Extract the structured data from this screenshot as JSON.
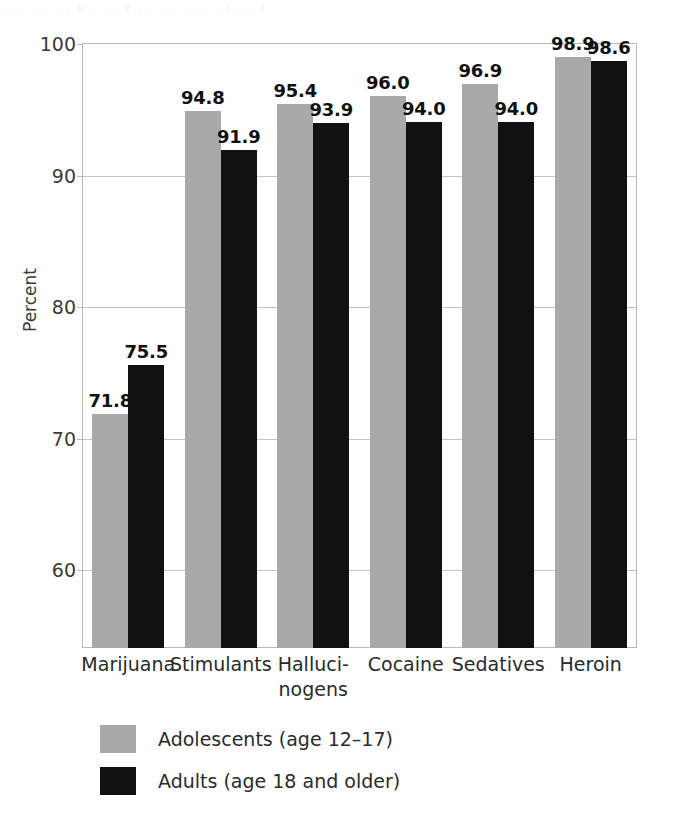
{
  "figure": {
    "cutoff_text": ". .   . . .   . .  p . . .  y . . . . . . .   . ( . . )",
    "background_color": "#ffffff"
  },
  "chart_data": {
    "type": "bar",
    "title": "",
    "subtitle": "",
    "xlabel": "",
    "ylabel": "Percent",
    "ylim": [
      54,
      100
    ],
    "yticks": [
      100,
      90,
      80,
      70,
      60
    ],
    "ytick_labels": [
      "100",
      "90",
      "80",
      "70",
      "60"
    ],
    "grid": true,
    "grid_axis": "y",
    "legend_position": "bottom-left",
    "categories": [
      "Marijuana",
      "Stimulants",
      "Halluci-\nnogens",
      "Cocaine",
      "Sedatives",
      "Heroin"
    ],
    "category_labels_flat": [
      "Marijuana",
      "Stimulants",
      "Hallucinogens",
      "Cocaine",
      "Sedatives",
      "Heroin"
    ],
    "series": [
      {
        "name": "Adolescents (age 12–17)",
        "color": "#a9a9a9",
        "values": [
          71.8,
          94.8,
          95.4,
          96.0,
          96.9,
          98.9
        ],
        "value_labels": [
          "71.8",
          "94.8",
          "95.4",
          "96.0",
          "96.9",
          "98.9"
        ]
      },
      {
        "name": "Adults (age 18 and older)",
        "color": "#111111",
        "values": [
          75.5,
          91.9,
          93.9,
          94.0,
          94.0,
          98.6
        ],
        "value_labels": [
          "75.5",
          "91.9",
          "93.9",
          "94.0",
          "94.0",
          "98.6"
        ]
      }
    ]
  },
  "legend": {
    "items": [
      {
        "label": "Adolescents (age 12–17)",
        "swatch": "adolescent"
      },
      {
        "label": "Adults (age 18 and older)",
        "swatch": "adult"
      }
    ]
  }
}
